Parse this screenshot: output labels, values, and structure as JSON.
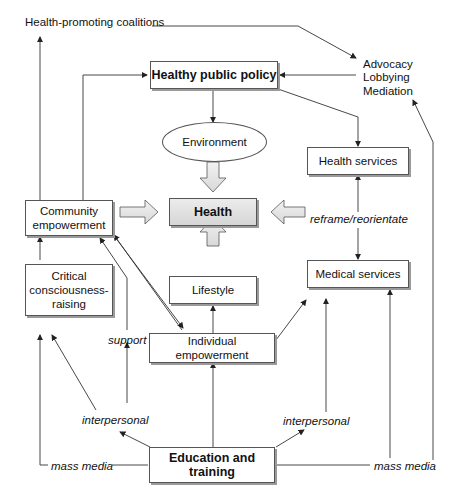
{
  "diagram": {
    "nodes": {
      "healthy_public_policy": "Healthy public policy",
      "environment": "Environment",
      "health": "Health",
      "health_services": "Health services",
      "community_empowerment": "Community empowerment",
      "critical_consciousness": "Critical consciousness-raising",
      "lifestyle": "Lifestyle",
      "medical_services": "Medical services",
      "individual_empowerment": "Individual empowerment",
      "education_training": "Education and training"
    },
    "labels": {
      "health_promoting_coalitions": "Health-promoting coalitions",
      "advocacy": "Advocacy",
      "lobbying": "Lobbying",
      "mediation": "Mediation",
      "reframe": "reframe/reorientate",
      "support": "support",
      "interpersonal_left": "interpersonal",
      "interpersonal_right": "interpersonal",
      "mass_media_left": "mass media",
      "mass_media_right": "mass media"
    },
    "colors": {
      "line": "#333333",
      "shadow": "#9a9a9a",
      "fat_arrow_fill": "#e6e6e6"
    }
  }
}
